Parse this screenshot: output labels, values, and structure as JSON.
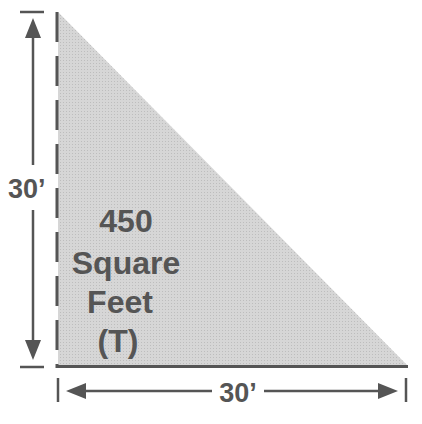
{
  "diagram": {
    "shape": "right-triangle",
    "fill_color": "#d3d3d3",
    "line_color": "#555555",
    "height_label": "30’",
    "width_label": "30’",
    "area_lines": [
      "450",
      "Square",
      "Feet",
      "(T)"
    ]
  }
}
